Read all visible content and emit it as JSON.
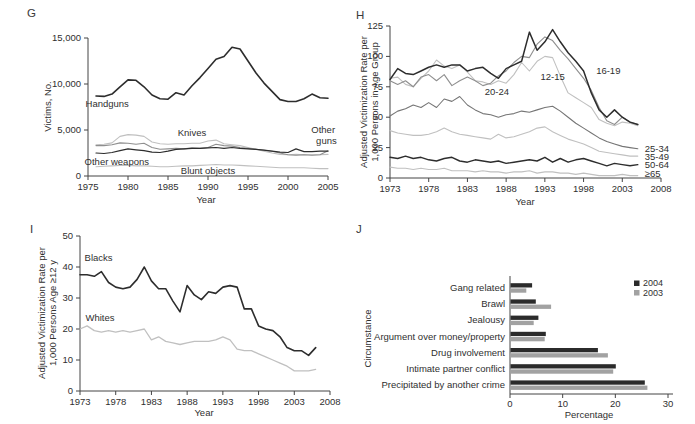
{
  "figure": {
    "panels": [
      {
        "id": "G",
        "label": "G"
      },
      {
        "id": "H",
        "label": "H"
      },
      {
        "id": "I",
        "label": "I"
      },
      {
        "id": "J",
        "label": "J"
      }
    ]
  },
  "colors": {
    "black": "#2d2d2d",
    "dark_gray": "#757575",
    "mid_gray": "#8f8f8f",
    "light_gray": "#c0c0c0",
    "bar_2004": "#2b2b2b",
    "bar_2003": "#a2a2a2",
    "axis": "#444444",
    "text": "#2f2f2f"
  },
  "chart_data": [
    {
      "panel": "G",
      "type": "line",
      "xlabel": "Year",
      "ylabel": "Victims, No.",
      "xlim": [
        1975,
        2005
      ],
      "ylim": [
        0,
        15000
      ],
      "xticks": [
        1975,
        1980,
        1985,
        1990,
        1995,
        2000,
        2005
      ],
      "yticks": [
        0,
        5000,
        10000,
        15000
      ],
      "ytick_labels": [
        "0",
        "5,000",
        "10,000",
        "15,000"
      ],
      "x_start": 1976,
      "series": [
        {
          "name": "Knives",
          "color_key": "light_gray",
          "width": 1.1,
          "values": [
            3400,
            3450,
            3600,
            4300,
            4500,
            4450,
            4300,
            3700,
            3500,
            3450,
            3500,
            3500,
            3550,
            3550,
            3800,
            3900,
            3500,
            3400,
            3300,
            3100,
            2900,
            2700,
            2500,
            2350,
            2300,
            2350,
            2300,
            2300,
            2300,
            2350
          ]
        },
        {
          "name": "Other guns",
          "color_key": "mid_gray",
          "width": 1.1,
          "values": [
            3300,
            3300,
            3400,
            3600,
            3550,
            3450,
            3550,
            3100,
            2900,
            2950,
            3000,
            2950,
            3050,
            3000,
            3100,
            3450,
            3300,
            3250,
            3100,
            3000,
            2900,
            2800,
            2700,
            2500,
            2300,
            2250,
            2300,
            2250,
            2300,
            2750
          ]
        },
        {
          "name": "Blunt objects",
          "color_key": "light_gray",
          "width": 1.1,
          "values": [
            1000,
            1050,
            1100,
            1150,
            1150,
            1100,
            1100,
            1050,
            1000,
            1000,
            1050,
            1100,
            1100,
            1150,
            1200,
            1250,
            1200,
            1200,
            1150,
            1100,
            1050,
            1000,
            950,
            900,
            900,
            900,
            900,
            850,
            800,
            800
          ]
        },
        {
          "name": "Other weapons",
          "color_key": "black",
          "width": 1.2,
          "values": [
            2500,
            2450,
            2550,
            2750,
            2950,
            2850,
            2750,
            2600,
            2550,
            2700,
            2900,
            2950,
            3000,
            3000,
            3050,
            3100,
            3000,
            3100,
            3000,
            2950,
            2900,
            2800,
            2700,
            2600,
            2550,
            2950,
            2650,
            2650,
            2700,
            2700
          ]
        },
        {
          "name": "Handguns",
          "color_key": "black",
          "width": 1.6,
          "values": [
            8700,
            8650,
            8900,
            9700,
            10450,
            10400,
            9700,
            8800,
            8400,
            8350,
            9050,
            8800,
            9800,
            10700,
            11700,
            12700,
            13000,
            14000,
            13800,
            12500,
            11200,
            10100,
            9200,
            8300,
            8100,
            8100,
            8400,
            8900,
            8500,
            8450
          ]
        }
      ],
      "annotations": [
        {
          "text": "Handguns",
          "x": 1977.4,
          "y": 7800
        },
        {
          "text": "Knives",
          "x": 1988,
          "y": 4700
        },
        {
          "text": "Other weapons",
          "x": 1978.6,
          "y": 1520
        },
        {
          "text": "Blunt objects",
          "x": 1990,
          "y": 500
        },
        {
          "text": "Other",
          "x": 2004.4,
          "y": 5000
        },
        {
          "text": "guns",
          "x": 2004.8,
          "y": 3800
        }
      ]
    },
    {
      "panel": "H",
      "type": "line",
      "xlabel": "Year",
      "ylabel": "Adjusted Victimization Rate per\n1,000 Persons in Age Group",
      "xlim": [
        1973,
        2008
      ],
      "ylim": [
        0,
        125
      ],
      "xticks": [
        1973,
        1978,
        1983,
        1988,
        1993,
        1998,
        2003,
        2008
      ],
      "yticks": [
        0,
        25,
        50,
        75,
        100,
        125
      ],
      "x_start": 1973,
      "series": [
        {
          "name": "20-24",
          "color_key": "light_gray",
          "width": 1.1,
          "values": [
            82,
            83,
            77,
            75,
            82,
            88,
            97,
            92,
            90,
            93,
            87,
            80,
            79,
            77,
            80,
            78,
            85,
            95,
            88,
            96,
            100,
            99,
            84,
            70,
            66,
            62,
            58,
            48,
            45,
            43,
            46,
            45,
            43
          ]
        },
        {
          "name": "35-49",
          "color_key": "light_gray",
          "width": 1.1,
          "values": [
            39,
            37,
            36,
            35,
            35,
            36,
            38,
            41,
            38,
            36,
            35,
            34,
            33,
            32,
            36,
            33,
            34,
            36,
            38,
            41,
            42,
            38,
            35,
            32,
            30,
            28,
            25,
            22,
            21,
            20,
            19,
            18,
            18
          ]
        },
        {
          "name": "≥65",
          "color_key": "light_gray",
          "width": 1.1,
          "values": [
            9,
            8,
            8,
            7,
            8,
            7,
            7,
            8,
            6,
            6,
            6,
            5,
            6,
            5,
            5,
            4,
            5,
            5,
            6,
            4,
            5,
            5,
            4,
            4,
            3,
            4,
            3,
            2,
            2,
            2,
            3,
            2,
            2
          ]
        },
        {
          "name": "12-15",
          "color_key": "mid_gray",
          "width": 1.1,
          "values": [
            80,
            77,
            80,
            75,
            83,
            85,
            80,
            85,
            76,
            80,
            83,
            80,
            76,
            78,
            84,
            88,
            95,
            100,
            99,
            110,
            116,
            113,
            105,
            98,
            90,
            82,
            72,
            58,
            47,
            44,
            50,
            46,
            44
          ]
        },
        {
          "name": "25-34",
          "color_key": "dark_gray",
          "width": 1.1,
          "values": [
            51,
            55,
            57,
            60,
            58,
            62,
            58,
            65,
            63,
            67,
            60,
            56,
            53,
            52,
            50,
            52,
            53,
            55,
            54,
            56,
            58,
            59,
            55,
            50,
            45,
            41,
            37,
            33,
            30,
            28,
            26,
            25,
            24
          ]
        },
        {
          "name": "50-64",
          "color_key": "black",
          "width": 1.4,
          "values": [
            17,
            16,
            18,
            16,
            17,
            15,
            14,
            16,
            17,
            14,
            13,
            15,
            14,
            13,
            14,
            12,
            13,
            14,
            15,
            14,
            17,
            13,
            16,
            13,
            15,
            16,
            14,
            12,
            10,
            12,
            11,
            10,
            11
          ]
        },
        {
          "name": "16-19",
          "color_key": "black",
          "width": 1.5,
          "values": [
            81,
            90,
            86,
            85,
            88,
            91,
            93,
            91,
            93,
            93,
            88,
            90,
            91,
            86,
            82,
            90,
            93,
            96,
            120,
            105,
            112,
            122,
            112,
            103,
            96,
            88,
            70,
            56,
            50,
            56,
            50,
            46,
            44
          ]
        }
      ],
      "annotations": [
        {
          "text": "20-24",
          "x": 1986.8,
          "y": 71
        },
        {
          "text": "12-15",
          "x": 1994,
          "y": 83
        },
        {
          "text": "16-19",
          "x": 2001.2,
          "y": 88
        },
        {
          "text": "25-34",
          "x": 2005.9,
          "y": 24,
          "anchor": "start"
        },
        {
          "text": "35-49",
          "x": 2005.9,
          "y": 17.5,
          "anchor": "start"
        },
        {
          "text": "50-64",
          "x": 2005.9,
          "y": 11,
          "anchor": "start"
        },
        {
          "text": "≥65",
          "x": 2005.9,
          "y": 3.5,
          "anchor": "start"
        }
      ]
    },
    {
      "panel": "I",
      "type": "line",
      "xlabel": "Year",
      "ylabel": "Adjusted Victimization Rate per\n1,000 Persons Age ≥12 y",
      "xlim": [
        1973,
        2008
      ],
      "ylim": [
        0,
        50
      ],
      "xticks": [
        1973,
        1978,
        1983,
        1988,
        1993,
        1998,
        2003,
        2008
      ],
      "yticks": [
        0,
        10,
        20,
        30,
        40,
        50
      ],
      "x_start": 1973,
      "series": [
        {
          "name": "Whites",
          "color_key": "light_gray",
          "width": 1.3,
          "values": [
            20,
            21,
            19.5,
            19,
            19.5,
            19,
            19.5,
            19,
            19.5,
            20,
            16.5,
            17.5,
            16,
            15.5,
            15,
            15.5,
            16,
            16,
            16,
            16.5,
            17.5,
            16.5,
            13.5,
            13,
            13,
            12,
            11,
            10,
            9,
            8,
            6.5,
            6.5,
            6.5,
            7
          ]
        },
        {
          "name": "Blacks",
          "color_key": "black",
          "width": 1.6,
          "values": [
            37.5,
            37.5,
            37,
            38.5,
            35,
            33.5,
            33,
            33.5,
            36,
            40,
            35.5,
            33,
            33,
            29,
            25.5,
            34,
            31,
            29.5,
            32,
            31.5,
            33.5,
            34,
            33.5,
            26.5,
            26.5,
            21,
            20,
            19.5,
            17.5,
            14,
            13,
            13,
            11.5,
            14
          ]
        }
      ],
      "annotations": [
        {
          "text": "Blacks",
          "x": 1975.6,
          "y": 43
        },
        {
          "text": "Whites",
          "x": 1975.8,
          "y": 23.5
        }
      ]
    },
    {
      "panel": "J",
      "type": "bar",
      "xlabel": "Percentage",
      "ylabel": "Circumstance",
      "xlim": [
        0,
        30
      ],
      "xticks": [
        0,
        10,
        20,
        30
      ],
      "categories": [
        "Gang related",
        "Brawl",
        "Jealousy",
        "Argument over money/property",
        "Drug involvement",
        "Intimate partner conflict",
        "Precipitated by another crime"
      ],
      "series": [
        {
          "name": "2004",
          "color_key": "bar_2004",
          "values": [
            4.1,
            4.8,
            5.3,
            6.7,
            16.6,
            20,
            25.5
          ]
        },
        {
          "name": "2003",
          "color_key": "bar_2003",
          "values": [
            3,
            7.7,
            4.4,
            6.5,
            18.5,
            19.5,
            26
          ]
        }
      ]
    }
  ]
}
